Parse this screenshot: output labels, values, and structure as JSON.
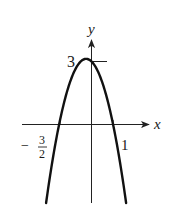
{
  "chart_data": {
    "type": "line",
    "title": "",
    "function": "y = -2x^2 - x + 3",
    "xlabel": "x",
    "ylabel": "y",
    "annotations": {
      "y_intercept_label": "3",
      "left_zero_label_sign": "−",
      "left_zero_label_num": "3",
      "left_zero_label_den": "2",
      "right_zero_label": "1"
    },
    "key_points": [
      {
        "x": -1.5,
        "y": 0,
        "label": "-3/2"
      },
      {
        "x": 1,
        "y": 0,
        "label": "1"
      },
      {
        "x": 0,
        "y": 3,
        "label": "3"
      },
      {
        "x": -0.25,
        "y": 3.125,
        "label": "vertex"
      }
    ],
    "x": [
      -2.15,
      -2.0,
      -1.75,
      -1.5,
      -1.25,
      -1.0,
      -0.75,
      -0.5,
      -0.25,
      0.0,
      0.25,
      0.5,
      0.75,
      1.0,
      1.25,
      1.5,
      1.7
    ],
    "values": [
      -1.095,
      -3.0,
      -1.375,
      0.0,
      1.125,
      2.0,
      2.625,
      3.0,
      3.125,
      3.0,
      2.625,
      2.0,
      1.125,
      0.0,
      -1.375,
      -3.0,
      -4.48
    ],
    "xlim": [
      -3.2,
      2.7
    ],
    "ylim": [
      -3.8,
      4.0
    ],
    "grid": false,
    "legend": null
  },
  "style": {
    "curve_color": "#111111",
    "axis_color": "#222222"
  }
}
